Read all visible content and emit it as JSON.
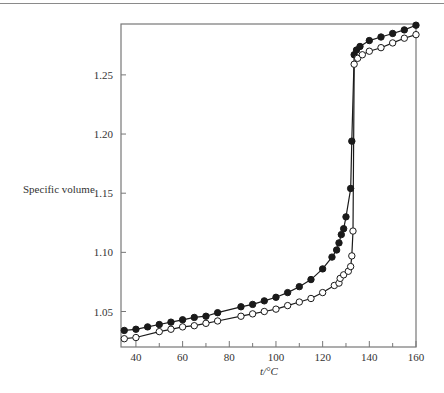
{
  "chart_data": {
    "type": "line",
    "title": "",
    "xlabel": "t/°C",
    "ylabel": "Specific volume",
    "xlim": [
      33.6,
      160
    ],
    "ylim": [
      1.02,
      1.293
    ],
    "xticks": [
      40,
      60,
      80,
      100,
      120,
      140,
      160
    ],
    "xminor_ticks": [
      50,
      70,
      90,
      110,
      130,
      150
    ],
    "yticks": [
      1.05,
      1.1,
      1.15,
      1.2,
      1.25
    ],
    "ytick_labels": [
      "1.05",
      "1.10",
      "1.15",
      "1.20",
      "1.25"
    ],
    "xtick_labels": [
      "40",
      "60",
      "80",
      "100",
      "120",
      "140",
      "160"
    ],
    "grid": false,
    "legend": null,
    "series": [
      {
        "name": "filled circles",
        "marker": "filled-circle",
        "x": [
          35,
          40,
          45,
          50,
          55,
          60,
          65,
          70,
          75,
          85,
          90,
          95,
          100,
          105,
          110,
          115,
          120,
          124,
          126,
          127,
          128,
          129,
          130,
          132,
          132.5,
          133.5,
          134.5,
          136,
          140,
          145,
          150,
          155,
          160
        ],
        "y": [
          1.034,
          1.035,
          1.037,
          1.039,
          1.041,
          1.043,
          1.045,
          1.046,
          1.049,
          1.054,
          1.056,
          1.059,
          1.062,
          1.066,
          1.071,
          1.077,
          1.086,
          1.096,
          1.102,
          1.108,
          1.115,
          1.12,
          1.13,
          1.154,
          1.194,
          1.267,
          1.271,
          1.274,
          1.279,
          1.282,
          1.285,
          1.288,
          1.292
        ]
      },
      {
        "name": "open circles",
        "marker": "open-circle",
        "x": [
          35,
          40,
          50,
          55,
          60,
          65,
          70,
          75,
          85,
          90,
          95,
          100,
          105,
          110,
          115,
          120,
          125,
          127,
          127.5,
          129,
          131,
          132,
          132.5,
          133,
          133.5,
          135,
          137,
          140,
          145,
          150,
          155,
          160
        ],
        "y": [
          1.027,
          1.028,
          1.033,
          1.035,
          1.037,
          1.038,
          1.04,
          1.042,
          1.046,
          1.048,
          1.05,
          1.052,
          1.055,
          1.058,
          1.061,
          1.066,
          1.072,
          1.074,
          1.078,
          1.081,
          1.084,
          1.088,
          1.097,
          1.118,
          1.259,
          1.264,
          1.267,
          1.27,
          1.273,
          1.277,
          1.281,
          1.284
        ]
      }
    ]
  },
  "colors": {
    "axis": "#777777",
    "series": "#1a1a1a",
    "text": "#333333"
  }
}
